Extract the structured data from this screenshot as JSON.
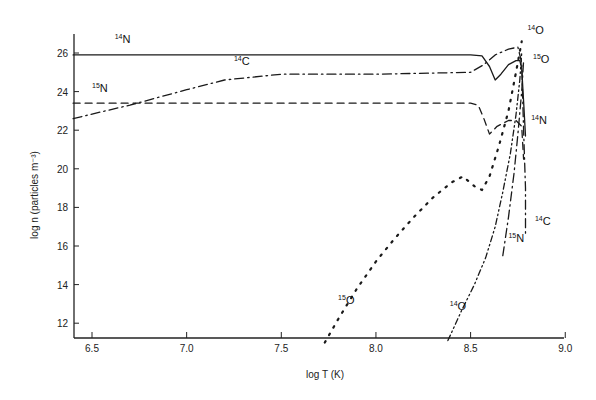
{
  "chart_data": {
    "type": "line",
    "title": "",
    "xlabel": "log T (K)",
    "ylabel": "log n (particles m⁻³)",
    "xlim": [
      6.4,
      9.0
    ],
    "ylim": [
      11,
      27
    ],
    "xticks": [
      6.5,
      7.0,
      7.5,
      8.0,
      8.5,
      9.0
    ],
    "xtick_labels": [
      "6.5",
      "7.0",
      "7.5",
      "8.0",
      "8.5",
      "9.0"
    ],
    "yticks": [
      12,
      14,
      16,
      18,
      20,
      22,
      24,
      26
    ],
    "ytick_labels": [
      "12",
      "14",
      "16",
      "18",
      "20",
      "22",
      "24",
      "26"
    ],
    "grid": false,
    "legend": "inline curve labels",
    "series": [
      {
        "name": "14N",
        "label_mass": "14",
        "label_elem": "N",
        "style": "solid",
        "x": [
          6.4,
          7.0,
          7.5,
          8.0,
          8.5,
          8.56,
          8.6,
          8.63,
          8.66,
          8.7,
          8.74,
          8.76,
          8.77,
          8.78,
          8.79
        ],
        "y": [
          25.9,
          25.9,
          25.9,
          25.9,
          25.9,
          25.85,
          25.3,
          24.6,
          24.9,
          25.4,
          25.6,
          25.6,
          25.2,
          23.5,
          21.7
        ]
      },
      {
        "name": "14C",
        "label_mass": "14",
        "label_elem": "C",
        "style": "dash-dot",
        "x": [
          6.4,
          6.7,
          7.0,
          7.2,
          7.5,
          8.0,
          8.5,
          8.57,
          8.63,
          8.7,
          8.75,
          8.77,
          8.78,
          8.79,
          8.79
        ],
        "y": [
          22.6,
          23.3,
          24.1,
          24.6,
          24.9,
          24.9,
          25.0,
          25.4,
          25.9,
          26.2,
          26.3,
          25.5,
          22.0,
          19.0,
          16.5
        ]
      },
      {
        "name": "15N (upper)",
        "label_mass": "15",
        "label_elem": "N",
        "style": "dashed",
        "x": [
          6.4,
          7.0,
          7.5,
          8.0,
          8.5,
          8.54,
          8.57,
          8.6,
          8.64,
          8.7,
          8.74,
          8.77,
          8.78
        ],
        "y": [
          23.4,
          23.4,
          23.4,
          23.4,
          23.4,
          23.3,
          22.6,
          21.8,
          22.2,
          22.5,
          22.5,
          22.2,
          20.5
        ]
      },
      {
        "name": "15O",
        "label_mass": "15",
        "label_elem": "O",
        "style": "dotted",
        "x": [
          7.73,
          7.8,
          7.9,
          8.0,
          8.1,
          8.2,
          8.3,
          8.4,
          8.46,
          8.52,
          8.56,
          8.6,
          8.65,
          8.7,
          8.74,
          8.77
        ],
        "y": [
          11.0,
          12.2,
          13.8,
          15.2,
          16.4,
          17.5,
          18.5,
          19.3,
          19.6,
          19.1,
          18.9,
          19.6,
          21.2,
          23.0,
          25.0,
          26.6
        ]
      },
      {
        "name": "14O",
        "label_mass": "14",
        "label_elem": "O",
        "style": "dash-dot-dot",
        "x": [
          8.38,
          8.45,
          8.52,
          8.58,
          8.63,
          8.67,
          8.71,
          8.74,
          8.76,
          8.77
        ],
        "y": [
          11.1,
          12.6,
          14.0,
          15.4,
          17.0,
          18.8,
          20.8,
          22.8,
          24.6,
          26.0
        ]
      },
      {
        "name": "15N (lower)",
        "label_mass": "15",
        "label_elem": "N",
        "style": "dash-dot",
        "x": [
          8.67,
          8.7,
          8.73,
          8.75,
          8.77,
          8.78
        ],
        "y": [
          15.5,
          17.5,
          19.8,
          21.8,
          24.0,
          25.6
        ]
      }
    ],
    "annotations": [
      {
        "text": "14N",
        "x": 6.62,
        "y": 26.5
      },
      {
        "text": "14C",
        "x": 7.25,
        "y": 25.4
      },
      {
        "text": "15N",
        "x": 6.5,
        "y": 24.0
      },
      {
        "text": "14O",
        "x": 8.8,
        "y": 27.0
      },
      {
        "text": "15O",
        "x": 8.83,
        "y": 25.5
      },
      {
        "text": "14N",
        "x": 8.82,
        "y": 22.3
      },
      {
        "text": "14C",
        "x": 8.84,
        "y": 17.1
      },
      {
        "text": "15N",
        "x": 8.7,
        "y": 16.2
      },
      {
        "text": "15O",
        "x": 7.8,
        "y": 13.0
      },
      {
        "text": "14O",
        "x": 8.39,
        "y": 12.7
      }
    ]
  }
}
